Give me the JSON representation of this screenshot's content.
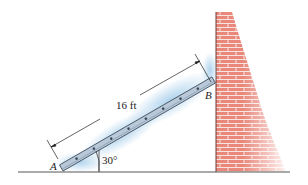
{
  "figure": {
    "labels": {
      "point_a": "A",
      "point_b": "B",
      "length": "16 ft",
      "angle": "30°"
    },
    "colors": {
      "brick": "#e8877a",
      "mortar": "#f8e4df",
      "ladder": "#b9c8d8",
      "shadow": "#8fc1e6",
      "ground": "#555555"
    }
  }
}
